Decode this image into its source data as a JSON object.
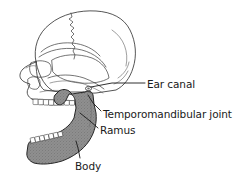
{
  "figure": {
    "kind": "anatomical-line-drawing",
    "background_color": "#ffffff",
    "line_color": "#1a1a1a",
    "mandible_fill_color": "#8a8a8a"
  },
  "labels": {
    "ear_canal": "Ear canal",
    "temporomandibular_joint": "Temporomandibular joint",
    "ramus": "Ramus",
    "body": "Body"
  },
  "parts": {
    "cranium": "cranium",
    "mandible": "mandible",
    "maxilla": "maxilla",
    "nasal_cavity": "nasal-cavity",
    "orbit": "orbit",
    "zygomatic_arch": "zygomatic-arch",
    "upper_teeth": "upper-teeth",
    "lower_teeth": "lower-teeth",
    "coronoid_process": "coronoid-process",
    "condyle": "condyle",
    "sutures": "cranial-sutures"
  }
}
